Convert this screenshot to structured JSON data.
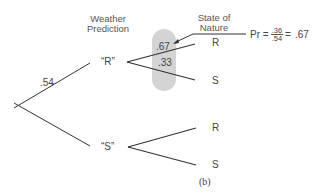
{
  "headers": {
    "weather_prediction": [
      "Weather",
      "Prediction"
    ],
    "state_of_nature": [
      "State of",
      "Nature"
    ]
  },
  "root_branch": {
    "probability": ".54"
  },
  "nodes": [
    {
      "label": "“R”",
      "outcomes": [
        {
          "label": "R",
          "probability": ".67"
        },
        {
          "label": "S",
          "probability": ".33"
        }
      ]
    },
    {
      "label": "“S”",
      "outcomes": [
        {
          "label": "R"
        },
        {
          "label": "S"
        }
      ]
    }
  ],
  "annotation": {
    "prefix": "Pr =",
    "numerator": ".36",
    "denominator": ".54",
    "equals": "=",
    "result": ".67"
  },
  "highlight_color": "#d4d4d4",
  "line_color": "#333333",
  "caption": "(b)"
}
